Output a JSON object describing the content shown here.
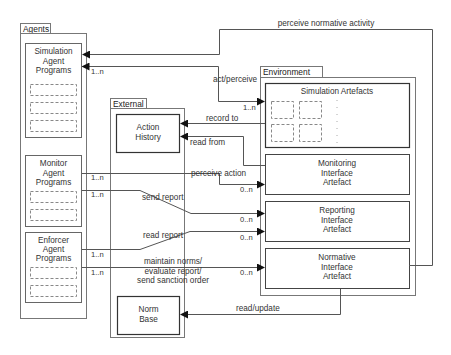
{
  "containers": {
    "agents": {
      "label": "Agents"
    },
    "external": {
      "label": "External"
    },
    "environment": {
      "label": "Environment"
    }
  },
  "agents": {
    "simulation": [
      "Simulation",
      "Agent",
      "Programs"
    ],
    "monitor": [
      "Monitor",
      "Agent",
      "Programs"
    ],
    "enforcer": [
      "Enforcer",
      "Agent",
      "Programs"
    ]
  },
  "external": {
    "action_history": [
      "Action",
      "History"
    ],
    "norm_base": [
      "Norm",
      "Base"
    ]
  },
  "environment": {
    "simulation_artefacts": "Simulation Artefacts",
    "monitoring": [
      "Monitoring",
      "Interface",
      "Artefact"
    ],
    "reporting": [
      "Reporting",
      "Interface",
      "Artefact"
    ],
    "normative": [
      "Normative",
      "Interface",
      "Artefact"
    ]
  },
  "edges": {
    "perceive_normative_activity": "perceive normative activity",
    "act_perceive": "act/perceive",
    "record_to": "record to",
    "read_from": "read from",
    "perceive_action": "perceive action",
    "send_report": "send report",
    "read_report": "read report",
    "maintain": [
      "maintain norms/",
      "evaluate report/",
      "send sanction order"
    ],
    "read_update": "read/update"
  },
  "multiplicities": {
    "one_n": "1..n",
    "zero_n": "0..n"
  }
}
